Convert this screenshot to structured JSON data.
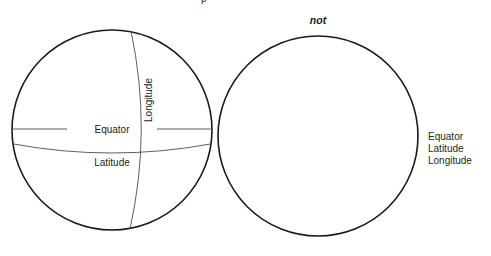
{
  "figure": {
    "title_fragment": "p",
    "background_color": "#ffffff",
    "stroke_color": "#1a1a1a",
    "grid_color": "#4d4d4d",
    "text_color": "#231f20"
  },
  "left_globe": {
    "name": "globe-with-coordinate-lines",
    "center_x": 112,
    "center_y": 130,
    "radius": 100,
    "labels": {
      "equator": "Equator",
      "latitude": "Latitude",
      "longitude": "Longitude"
    }
  },
  "right_globe": {
    "name": "plain-circle",
    "center_x": 318,
    "center_y": 136,
    "radius": 100,
    "caption": "not",
    "side_labels": [
      "Equator",
      "Latitude",
      "Longitude"
    ]
  }
}
